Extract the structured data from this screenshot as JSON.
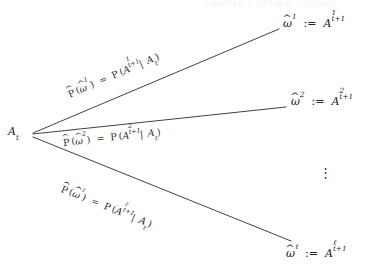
{
  "figure": {
    "type": "probability-tree",
    "page_header": "CHAPTER 4. OPTIMAL CONTROL",
    "background_color": "#ffffff",
    "line_color": "#2b2b2b"
  },
  "root": {
    "name": "root-node",
    "symbol": "A",
    "subscript": "t",
    "text": "A_t"
  },
  "branches": [
    {
      "index": 1,
      "edge_label": {
        "lhs_operator": "P",
        "lhs_arg_symbol": "ω",
        "lhs_arg_superscript": "1",
        "equals": "=",
        "rhs_operator": "P",
        "rhs_event_symbol": "A",
        "rhs_event_superscript": "1",
        "rhs_event_subscript": "t+1",
        "rhs_condition": "A_t",
        "text": "P̂(ω̂1) = P(A1_{t+1} | A_t)"
      },
      "endpoint_label": {
        "lhs_symbol": "ω",
        "lhs_superscript": "1",
        "assign": ":=",
        "rhs_symbol": "A",
        "rhs_superscript": "1",
        "rhs_subscript": "t+1",
        "text": "ω̂1 := A1_{t+1}"
      },
      "line": {
        "x1": 33,
        "y1": 133,
        "x2": 279,
        "y2": 29
      }
    },
    {
      "index": 2,
      "edge_label": {
        "lhs_operator": "P",
        "lhs_arg_symbol": "ω",
        "lhs_arg_superscript": "2",
        "equals": "=",
        "rhs_operator": "P",
        "rhs_event_symbol": "A",
        "rhs_event_superscript": "2",
        "rhs_event_subscript": "t+1",
        "rhs_condition": "A_t",
        "text": "P̂(ω̂2) = P(A2_{t+1} | A_t)"
      },
      "endpoint_label": {
        "lhs_symbol": "ω",
        "lhs_superscript": "2",
        "assign": ":=",
        "rhs_symbol": "A",
        "rhs_superscript": "2",
        "rhs_subscript": "t+1",
        "text": "ω̂2 := A2_{t+1}"
      },
      "line": {
        "x1": 33,
        "y1": 134,
        "x2": 286,
        "y2": 107
      }
    },
    {
      "index": 3,
      "edge_label": {
        "lhs_operator": "P",
        "lhs_arg_symbol": "ω",
        "lhs_arg_superscript": "ℓ",
        "equals": "=",
        "rhs_operator": "P",
        "rhs_event_symbol": "A",
        "rhs_event_superscript": "ℓ",
        "rhs_event_subscript": "t+1",
        "rhs_condition": "A_t",
        "text": "P̂(ω̂ℓ) = P(Aℓ_{t+1} | A_t)"
      },
      "endpoint_label": {
        "lhs_symbol": "ω",
        "lhs_superscript": "ℓ",
        "assign": ":=",
        "rhs_symbol": "A",
        "rhs_superscript": "ℓ",
        "rhs_subscript": "t+1",
        "text": "ω̂ℓ := Aℓ_{t+1}"
      },
      "line": {
        "x1": 33,
        "y1": 137,
        "x2": 291,
        "y2": 241
      }
    }
  ],
  "ellipsis": {
    "name": "vertical-ellipsis",
    "glyph": "⋮"
  },
  "symbols": {
    "hat": "̂",
    "omega": "ω",
    "blackboard_p": "P",
    "ell": "ℓ",
    "assign": ":=",
    "equals": "=",
    "conditional_bar": "|"
  }
}
